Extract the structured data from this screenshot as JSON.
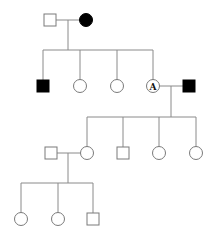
{
  "diagram": {
    "type": "pedigree",
    "colors": {
      "line": "#8a8a8a",
      "affected": "#000000",
      "unaffected": "#ffffff"
    },
    "generations": [
      {
        "index": 1,
        "individuals": [
          {
            "id": "I-1",
            "sex": "male",
            "affected": false,
            "label": ""
          },
          {
            "id": "I-2",
            "sex": "female",
            "affected": true,
            "label": ""
          }
        ]
      },
      {
        "index": 2,
        "individuals": [
          {
            "id": "II-1",
            "sex": "male",
            "affected": true,
            "label": ""
          },
          {
            "id": "II-2",
            "sex": "female",
            "affected": false,
            "label": ""
          },
          {
            "id": "II-3",
            "sex": "female",
            "affected": false,
            "label": ""
          },
          {
            "id": "II-4",
            "sex": "female",
            "affected": false,
            "label": "A"
          },
          {
            "id": "II-5",
            "sex": "male",
            "affected": true,
            "label": "",
            "spouse_of": "II-4"
          }
        ]
      },
      {
        "index": 3,
        "individuals": [
          {
            "id": "III-0",
            "sex": "male",
            "affected": false,
            "label": "",
            "spouse_of": "III-1"
          },
          {
            "id": "III-1",
            "sex": "female",
            "affected": false,
            "label": ""
          },
          {
            "id": "III-2",
            "sex": "male",
            "affected": false,
            "label": ""
          },
          {
            "id": "III-3",
            "sex": "female",
            "affected": false,
            "label": ""
          },
          {
            "id": "III-4",
            "sex": "female",
            "affected": false,
            "label": ""
          }
        ]
      },
      {
        "index": 4,
        "individuals": [
          {
            "id": "IV-1",
            "sex": "female",
            "affected": false,
            "label": ""
          },
          {
            "id": "IV-2",
            "sex": "female",
            "affected": false,
            "label": ""
          },
          {
            "id": "IV-3",
            "sex": "male",
            "affected": false,
            "label": ""
          }
        ]
      }
    ],
    "marker_label": "A"
  }
}
